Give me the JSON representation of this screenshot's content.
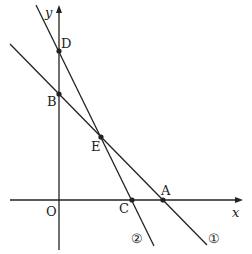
{
  "diagram": {
    "type": "coordinate-geometry",
    "axes": {
      "x_label": "x",
      "y_label": "y",
      "origin_label": "O"
    },
    "points": [
      {
        "name": "D",
        "label": "D",
        "on": "y-axis, line ②"
      },
      {
        "name": "B",
        "label": "B",
        "on": "y-axis, line ①"
      },
      {
        "name": "E",
        "label": "E",
        "on": "intersection of ① and ②"
      },
      {
        "name": "C",
        "label": "C",
        "on": "x-axis, line ②"
      },
      {
        "name": "A",
        "label": "A",
        "on": "x-axis, line ①"
      }
    ],
    "lines": [
      {
        "id": "1",
        "label": "①",
        "through": [
          "B",
          "E",
          "A"
        ]
      },
      {
        "id": "2",
        "label": "②",
        "through": [
          "D",
          "E",
          "C"
        ]
      }
    ],
    "colors": {
      "stroke": "#222222",
      "background": "#ffffff"
    }
  }
}
